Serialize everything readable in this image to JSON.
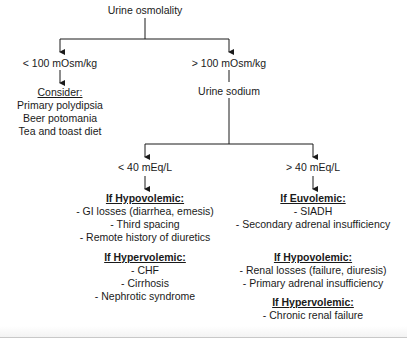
{
  "diagram": {
    "root": "Urine osmolality",
    "branch_low_osm": {
      "label": "< 100 mOsm/kg",
      "consider_heading": "Consider:",
      "items": [
        "Primary polydipsia",
        "Beer potomania",
        "Tea and toast diet"
      ]
    },
    "branch_high_osm": {
      "label": "> 100 mOsm/kg",
      "next": "Urine sodium",
      "low_sodium": {
        "label": "< 40 mEq/L",
        "groups": [
          {
            "heading": "If Hypovolemic:",
            "items": [
              "- GI losses (diarrhea, emesis)",
              "- Third spacing",
              "- Remote history of diuretics"
            ]
          },
          {
            "heading": "If Hypervolemic:",
            "items": [
              "- CHF",
              "- Cirrhosis",
              "- Nephrotic syndrome"
            ]
          }
        ]
      },
      "high_sodium": {
        "label": "> 40 mEq/L",
        "groups": [
          {
            "heading": "If Euvolemic:",
            "items": [
              "- SIADH",
              "- Secondary adrenal insufficiency"
            ]
          },
          {
            "heading": "If Hypovolemic:",
            "items": [
              "- Renal losses (failure, diuresis)",
              "- Primary adrenal insufficiency"
            ]
          },
          {
            "heading": "If Hypervolemic:",
            "items": [
              "- Chronic renal failure"
            ]
          }
        ]
      }
    }
  },
  "colors": {
    "line": "#1a1a1a",
    "text": "#1a1a1a",
    "background": "#ffffff"
  }
}
